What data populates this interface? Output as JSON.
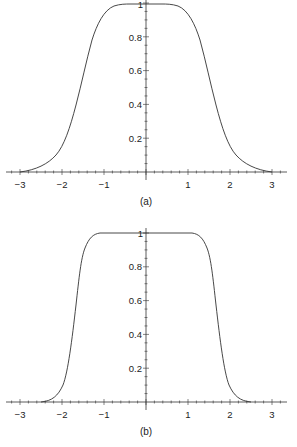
{
  "chart_data": [
    {
      "type": "line",
      "title": "",
      "caption": "(a)",
      "xlabel": "",
      "ylabel": "",
      "xlim": [
        -3.2,
        3.2
      ],
      "ylim": [
        0,
        1
      ],
      "x_ticks": [
        "-3",
        "-2",
        "-1",
        "1",
        "2",
        "3"
      ],
      "y_ticks": [
        "0.2",
        "0.4",
        "0.6",
        "0.8",
        "1"
      ],
      "grid": false,
      "series": [
        {
          "name": "profile a",
          "x": [
            -3,
            -2.8,
            -2.6,
            -2.4,
            -2.2,
            -2.0,
            -1.8,
            -1.6,
            -1.4,
            -1.2,
            -1.0,
            -0.8,
            -0.6,
            0,
            0.6,
            0.8,
            1.0,
            1.2,
            1.4,
            1.6,
            1.8,
            2.0,
            2.2,
            2.4,
            2.6,
            2.8,
            3
          ],
          "y": [
            0,
            0.02,
            0.05,
            0.1,
            0.19,
            0.33,
            0.52,
            0.74,
            0.89,
            0.96,
            0.99,
            1.0,
            1.0,
            1.0,
            1.0,
            1.0,
            0.99,
            0.96,
            0.89,
            0.74,
            0.52,
            0.33,
            0.19,
            0.1,
            0.05,
            0.02,
            0
          ]
        }
      ]
    },
    {
      "type": "line",
      "title": "",
      "caption": "(b)",
      "xlabel": "",
      "ylabel": "",
      "xlim": [
        -3.2,
        3.2
      ],
      "ylim": [
        0,
        1
      ],
      "x_ticks": [
        "-3",
        "-2",
        "-1",
        "1",
        "2",
        "3"
      ],
      "y_ticks": [
        "0.2",
        "0.4",
        "0.6",
        "0.8",
        "1"
      ],
      "grid": false,
      "series": [
        {
          "name": "profile b",
          "x": [
            -2.5,
            -2.3,
            -2.1,
            -1.9,
            -1.8,
            -1.7,
            -1.6,
            -1.5,
            -1.4,
            -1.3,
            -1.2,
            -1.1,
            0,
            1.1,
            1.2,
            1.3,
            1.4,
            1.5,
            1.6,
            1.7,
            1.8,
            1.9,
            2.1,
            2.3,
            2.5
          ],
          "y": [
            0,
            0.02,
            0.08,
            0.22,
            0.36,
            0.53,
            0.7,
            0.86,
            0.94,
            0.98,
            0.995,
            1.0,
            1.0,
            1.0,
            0.995,
            0.98,
            0.94,
            0.86,
            0.7,
            0.53,
            0.36,
            0.22,
            0.08,
            0.02,
            0
          ]
        }
      ]
    }
  ],
  "charts": {
    "a": {
      "caption": "(a)",
      "x_labels": [
        "−3",
        "−2",
        "−1",
        "1",
        "2",
        "3"
      ],
      "y_labels": [
        "0.2",
        "0.4",
        "0.6",
        "0.8",
        "1"
      ]
    },
    "b": {
      "caption": "(b)",
      "x_labels": [
        "−3",
        "−2",
        "−1",
        "1",
        "2",
        "3"
      ],
      "y_labels": [
        "0.2",
        "0.4",
        "0.6",
        "0.8",
        "1"
      ]
    }
  },
  "colors": {
    "line": "#333333",
    "axis": "#333333",
    "background": "#ffffff"
  }
}
